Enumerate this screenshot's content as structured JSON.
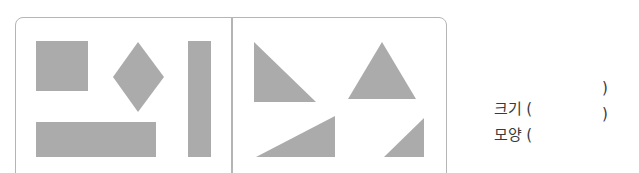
{
  "colors": {
    "shape_fill": "#ababab",
    "border": "#b5b5b5",
    "text": "#3a3a3a"
  },
  "groups": [
    {
      "name": "left-group",
      "shapes": [
        "square",
        "rhombus",
        "vertical-rectangle",
        "horizontal-rectangle"
      ]
    },
    {
      "name": "right-group",
      "shapes": [
        "right-triangle",
        "isosceles-triangle",
        "obtuse-right-triangle",
        "small-right-triangle"
      ]
    }
  ],
  "answers": {
    "size": {
      "label": "크기 (",
      "close": ")"
    },
    "shape": {
      "label": "모양 (",
      "close": ")"
    }
  }
}
